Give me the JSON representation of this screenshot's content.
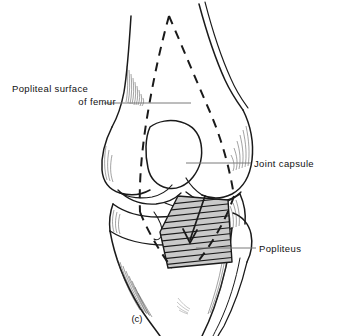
{
  "figure": {
    "caption": "(c)",
    "view": "posterior view of right knee joint",
    "background_color": "#ffffff",
    "line_color": "#1a1a1a",
    "shade_color": "#c9c9c9",
    "leader_color": "#7a7a7a"
  },
  "labels": {
    "popliteal_surface": {
      "line1": "Popliteal surface",
      "line2": "of femur"
    },
    "joint_capsule": "Joint capsule",
    "popliteus": "Popliteus"
  },
  "leaders": [
    {
      "name": "popliteal-surface-leader",
      "x1": 104,
      "y1": 103,
      "x2": 191,
      "y2": 103
    },
    {
      "name": "joint-capsule-leader",
      "x1": 186,
      "y1": 163,
      "x2": 251,
      "y2": 163
    },
    {
      "name": "popliteus-leader",
      "x1": 196,
      "y1": 248,
      "x2": 256,
      "y2": 248
    }
  ],
  "structures": [
    {
      "name": "femur-shaft",
      "kind": "bone-outline"
    },
    {
      "name": "medial-femoral-condyle",
      "kind": "bone-outline"
    },
    {
      "name": "lateral-femoral-condyle",
      "kind": "bone-outline"
    },
    {
      "name": "intercondylar-fossa",
      "kind": "bone-outline"
    },
    {
      "name": "tibial-plateau",
      "kind": "bone-outline"
    },
    {
      "name": "tibial-shaft",
      "kind": "bone-outline"
    },
    {
      "name": "fibula-head",
      "kind": "bone-outline"
    },
    {
      "name": "joint-capsule-attachment",
      "kind": "dashed-outline"
    },
    {
      "name": "popliteus-muscle",
      "kind": "shaded-hatched-region"
    },
    {
      "name": "popliteus-fiber-direction-arrow",
      "kind": "arrow"
    }
  ]
}
